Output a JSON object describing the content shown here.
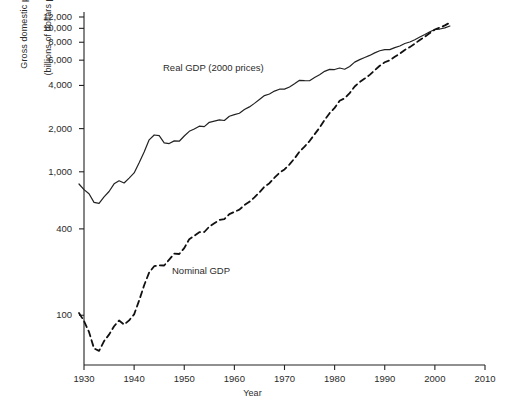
{
  "chart_data": {
    "type": "line",
    "title": "",
    "xlabel": "Year",
    "ylabel_line1": "Gross domestic product",
    "ylabel_line2": "(billions of dollars per year)",
    "yscale": "log",
    "xlim": [
      1930,
      2010
    ],
    "ylim": [
      45,
      13000
    ],
    "grid": false,
    "legend_position": "inline-annotation",
    "xticks": [
      "1930",
      "1940",
      "1950",
      "1960",
      "1970",
      "1980",
      "1990",
      "2000",
      "2010"
    ],
    "xtick_values": [
      1930,
      1940,
      1950,
      1960,
      1970,
      1980,
      1990,
      2000,
      2010
    ],
    "yticks": [
      "12,000",
      "10,000",
      "8,000",
      "6,000",
      "4,000",
      "2,000",
      "1,000",
      "400",
      "100"
    ],
    "ytick_values": [
      12000,
      10000,
      8000,
      6000,
      4000,
      2000,
      1000,
      400,
      100
    ],
    "series": [
      {
        "name": "Real GDP (2000 prices)",
        "style": "solid",
        "color": "#222222",
        "x": [
          1929,
          1930,
          1931,
          1932,
          1933,
          1934,
          1935,
          1936,
          1937,
          1938,
          1939,
          1940,
          1941,
          1942,
          1943,
          1944,
          1945,
          1946,
          1947,
          1948,
          1949,
          1950,
          1951,
          1952,
          1953,
          1954,
          1955,
          1956,
          1957,
          1958,
          1959,
          1960,
          1961,
          1962,
          1963,
          1964,
          1965,
          1966,
          1967,
          1968,
          1969,
          1970,
          1971,
          1972,
          1973,
          1974,
          1975,
          1976,
          1977,
          1978,
          1979,
          1980,
          1981,
          1982,
          1983,
          1984,
          1985,
          1986,
          1987,
          1988,
          1989,
          1990,
          1991,
          1992,
          1993,
          1994,
          1995,
          1996,
          1997,
          1998,
          1999,
          2000,
          2001,
          2002,
          2003
        ],
        "values": [
          822,
          751,
          703,
          612,
          603,
          669,
          729,
          824,
          866,
          836,
          904,
          982,
          1155,
          1373,
          1670,
          1806,
          1786,
          1590,
          1574,
          1643,
          1634,
          1777,
          1915,
          1988,
          2079,
          2066,
          2213,
          2256,
          2301,
          2279,
          2441,
          2502,
          2560,
          2715,
          2834,
          2999,
          3192,
          3399,
          3485,
          3652,
          3766,
          3772,
          3899,
          4105,
          4342,
          4320,
          4311,
          4541,
          4751,
          5015,
          5173,
          5162,
          5292,
          5189,
          5424,
          5814,
          6054,
          6264,
          6475,
          6743,
          6981,
          7113,
          7101,
          7337,
          7533,
          7836,
          8032,
          8329,
          8704,
          9067,
          9470,
          9817,
          9891,
          10075,
          10381
        ]
      },
      {
        "name": "Nominal GDP",
        "style": "dashed",
        "color": "#111111",
        "x": [
          1929,
          1930,
          1931,
          1932,
          1933,
          1934,
          1935,
          1936,
          1937,
          1938,
          1939,
          1940,
          1941,
          1942,
          1943,
          1944,
          1945,
          1946,
          1947,
          1948,
          1949,
          1950,
          1951,
          1952,
          1953,
          1954,
          1955,
          1956,
          1957,
          1958,
          1959,
          1960,
          1961,
          1962,
          1963,
          1964,
          1965,
          1966,
          1967,
          1968,
          1969,
          1970,
          1971,
          1972,
          1973,
          1974,
          1975,
          1976,
          1977,
          1978,
          1979,
          1980,
          1981,
          1982,
          1983,
          1984,
          1985,
          1986,
          1987,
          1988,
          1989,
          1990,
          1991,
          1992,
          1993,
          1994,
          1995,
          1996,
          1997,
          1998,
          1999,
          2000,
          2001,
          2002,
          2003
        ],
        "values": [
          103.6,
          91.2,
          76.5,
          58.7,
          56.4,
          66.0,
          73.3,
          83.8,
          91.9,
          86.1,
          92.2,
          101.4,
          126.7,
          161.9,
          198.6,
          219.8,
          223.1,
          222.3,
          244.2,
          269.2,
          267.3,
          293.8,
          339.3,
          358.3,
          379.4,
          380.4,
          414.8,
          437.5,
          461.1,
          467.2,
          506.6,
          526.4,
          544.7,
          585.6,
          617.7,
          663.6,
          719.1,
          787.8,
          832.6,
          910.0,
          984.6,
          1038.5,
          1127.1,
          1238.3,
          1382.7,
          1500.0,
          1638.3,
          1825.3,
          2030.9,
          2294.7,
          2563.3,
          2789.5,
          3128.4,
          3255.0,
          3536.7,
          3933.2,
          4220.3,
          4462.8,
          4739.5,
          5103.8,
          5484.4,
          5803.1,
          5995.9,
          6337.7,
          6657.4,
          7072.2,
          7397.7,
          7816.9,
          8304.3,
          8747.0,
          9268.4,
          9817.0,
          10128.0,
          10487.0,
          10971.0
        ]
      }
    ]
  }
}
